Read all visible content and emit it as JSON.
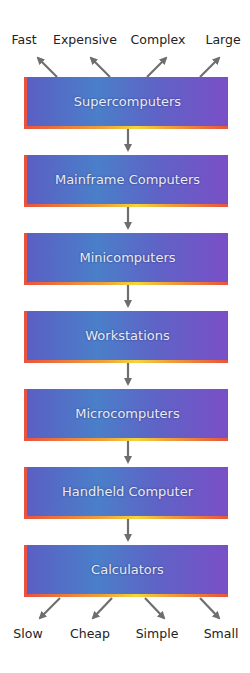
{
  "top_labels": [
    "Fast",
    "Expensive",
    "Complex",
    "Large"
  ],
  "bottom_labels": [
    "Slow",
    "Cheap",
    "Simple",
    "Small"
  ],
  "boxes": [
    "Supercomputers",
    "Mainframe Computers",
    "Minicomputers",
    "Workstations",
    "Microcomputers",
    "Handheld Computer",
    "Calculators"
  ],
  "colors": {
    "box_left": "#5b5fc4",
    "box_mid": "#4a7fc9",
    "box_right": "#7a4fc6",
    "edge_red": "#e8533f",
    "edge_yellow": "#f3d53a",
    "arrow": "#6e6e6e"
  }
}
